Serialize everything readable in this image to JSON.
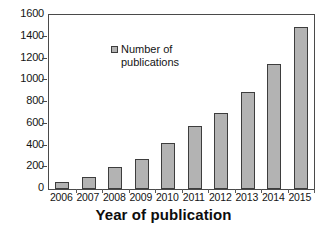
{
  "chart_data": {
    "type": "bar",
    "title": "",
    "subtitle": "",
    "xlabel": "Year of publication",
    "ylabel": "",
    "categories": [
      "2006",
      "2007",
      "2008",
      "2009",
      "2010",
      "2011",
      "2012",
      "2013",
      "2014",
      "2015"
    ],
    "values": [
      65,
      110,
      200,
      275,
      425,
      575,
      700,
      890,
      1145,
      1490
    ],
    "series": [
      {
        "name": "Number of publications",
        "values": [
          65,
          110,
          200,
          275,
          425,
          575,
          700,
          890,
          1145,
          1490
        ]
      }
    ],
    "ylim": [
      0,
      1600
    ],
    "ytick_values": [
      0,
      200,
      400,
      600,
      800,
      1000,
      1200,
      1400,
      1600
    ],
    "ytick_labels": [
      "0",
      "200",
      "400",
      "600",
      "800",
      "1000",
      "1200",
      "1400",
      "1600"
    ],
    "grid": false,
    "legend": {
      "position": "inside-top-left",
      "entries": [
        "Number of\npublications"
      ]
    },
    "colors": {
      "bar_fill": "#b3b3b3",
      "bar_border": "#3d3d3d",
      "axis": "#4a4a4a",
      "text": "#141414",
      "background": "#ffffff"
    }
  }
}
